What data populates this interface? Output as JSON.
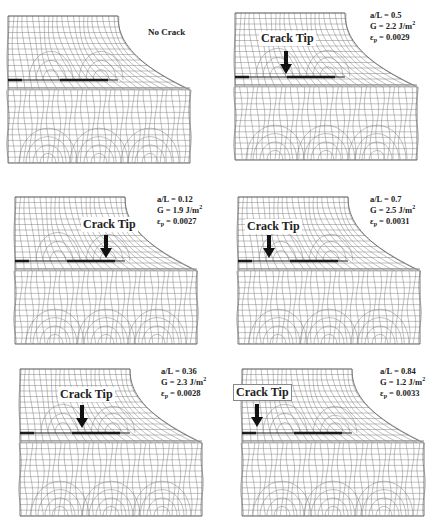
{
  "figure": {
    "mesh_color": "#777777",
    "crack_color": "#1a1a1a",
    "panels": [
      {
        "id": "no-crack",
        "title": "No Crack",
        "crack_tip_label": null,
        "params": null
      },
      {
        "id": "aL-0.5",
        "crack_tip_label": "Crack Tip",
        "params": {
          "aL": "a/L = 0.5",
          "G": "G = 2.2 J/m",
          "G_exp": "2",
          "eps": "ε",
          "eps_sub": "p",
          "eps_val": " = 0.0029"
        }
      },
      {
        "id": "aL-0.12",
        "crack_tip_label": "Crack Tip",
        "params": {
          "aL": "a/L = 0.12",
          "G": "G = 1.9 J/m",
          "G_exp": "2",
          "eps": "ε",
          "eps_sub": "p",
          "eps_val": " = 0.0027"
        }
      },
      {
        "id": "aL-0.7",
        "crack_tip_label": "Crack Tip",
        "params": {
          "aL": "a/L = 0.7",
          "G": "G = 2.5 J/m",
          "G_exp": "2",
          "eps": "ε",
          "eps_sub": "p",
          "eps_val": " = 0.0031"
        }
      },
      {
        "id": "aL-0.36",
        "crack_tip_label": "Crack Tip",
        "params": {
          "aL": "a/L = 0.36",
          "G": "G = 2.3 J/m",
          "G_exp": "2",
          "eps": "ε",
          "eps_sub": "p",
          "eps_val": " = 0.0028"
        }
      },
      {
        "id": "aL-0.84",
        "crack_tip_label": "Crack Tip",
        "params": {
          "aL": "a/L = 0.84",
          "G": "G = 1.2 J/m",
          "G_exp": "2",
          "eps": "ε",
          "eps_sub": "p",
          "eps_val": " = 0.0033"
        }
      }
    ]
  }
}
